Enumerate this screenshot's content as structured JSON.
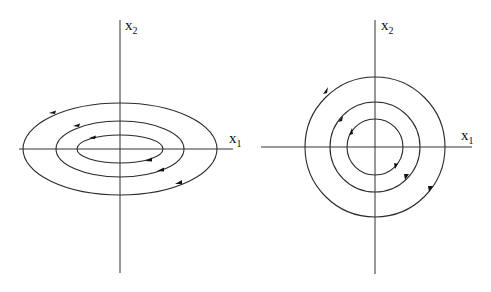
{
  "diagrams": [
    {
      "name": "elliptic-phase-portrait",
      "type": "ellipses",
      "center": [
        120,
        149
      ],
      "x_label": {
        "base": "x",
        "sub": "1"
      },
      "y_label": {
        "base": "x",
        "sub": "2"
      },
      "orbits": [
        {
          "rx": 43,
          "ry": 14
        },
        {
          "rx": 64,
          "ry": 28
        },
        {
          "rx": 97,
          "ry": 46
        }
      ],
      "direction": "clockwise"
    },
    {
      "name": "circular-phase-portrait",
      "type": "circles",
      "center": [
        375,
        147
      ],
      "x_label": {
        "base": "x",
        "sub": "1"
      },
      "y_label": {
        "base": "x",
        "sub": "2"
      },
      "orbits": [
        {
          "r": 28
        },
        {
          "r": 45
        },
        {
          "r": 70
        }
      ],
      "direction": "clockwise"
    }
  ]
}
